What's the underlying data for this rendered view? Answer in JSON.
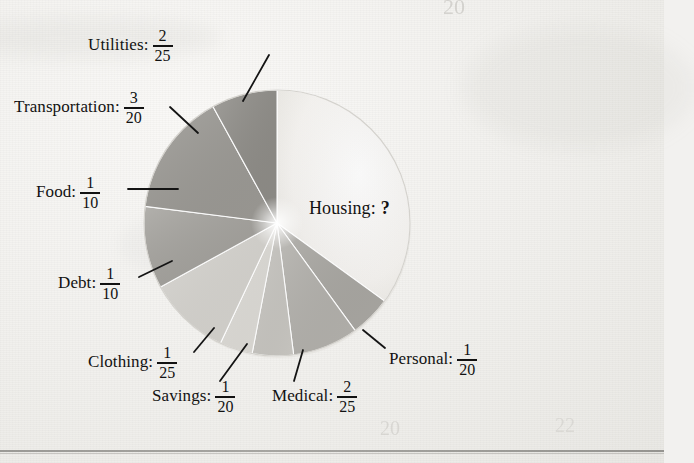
{
  "figure": {
    "unknown_label": "Housing: ?",
    "ghost_top_number": "20",
    "ghost_bottom_left_number": "20",
    "ghost_bottom_right_number": "22"
  },
  "housing": {
    "category": "Housing:",
    "value_text": "?"
  },
  "chart_data": {
    "type": "pie",
    "center_label": "Housing: ?",
    "grid": false,
    "legend": "none (direct labels with leader lines)",
    "categories": [
      "Housing",
      "Personal",
      "Medical",
      "Savings",
      "Clothing",
      "Debt",
      "Food",
      "Transportation",
      "Utilities"
    ],
    "labels": [
      "Housing: ?",
      "Personal: 1/20",
      "Medical: 2/25",
      "Savings: 1/20",
      "Clothing: 1/25",
      "Debt: 1/10",
      "Food: 1/10",
      "Transportation: 3/20",
      "Utilities: 2/25"
    ],
    "fractions": [
      "?",
      "1/20",
      "2/25",
      "1/20",
      "1/25",
      "1/10",
      "1/10",
      "3/20",
      "2/25"
    ],
    "values": [
      0.35,
      0.05,
      0.08,
      0.05,
      0.04,
      0.1,
      0.1,
      0.15,
      0.08
    ],
    "known_sum": 0.65,
    "unknown_value": 0.35
  },
  "slices": [
    {
      "name": "Housing",
      "category": "Housing:",
      "num": "",
      "den": "",
      "value": 0.35,
      "shade": "#f2f0ed"
    },
    {
      "name": "Personal",
      "category": "Personal:",
      "num": "1",
      "den": "20",
      "value": 0.05,
      "shade": "#a9a7a2"
    },
    {
      "name": "Medical",
      "category": "Medical:",
      "num": "2",
      "den": "25",
      "value": 0.08,
      "shade": "#b3b1ac"
    },
    {
      "name": "Savings",
      "category": "Savings:",
      "num": "1",
      "den": "20",
      "value": 0.05,
      "shade": "#c8c6c1"
    },
    {
      "name": "Clothing",
      "category": "Clothing:",
      "num": "1",
      "den": "25",
      "value": 0.04,
      "shade": "#dedcd7"
    },
    {
      "name": "Debt",
      "category": "Debt:",
      "num": "1",
      "den": "10",
      "value": 0.1,
      "shade": "#d6d4cf"
    },
    {
      "name": "Food",
      "category": "Food:",
      "num": "1",
      "den": "10",
      "value": 0.1,
      "shade": "#a3a19c"
    },
    {
      "name": "Transportation",
      "category": "Transportation:",
      "num": "3",
      "den": "20",
      "value": 0.15,
      "shade": "#9b9994"
    },
    {
      "name": "Utilities",
      "category": "Utilities:",
      "num": "2",
      "den": "25",
      "value": 0.08,
      "shade": "#8e8c87"
    }
  ]
}
